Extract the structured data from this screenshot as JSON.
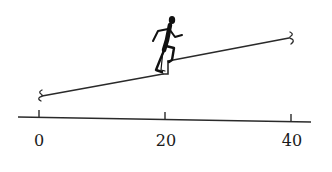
{
  "diagram": {
    "type": "inclined-track-with-runner",
    "axis": {
      "tick_labels": [
        "0",
        "20",
        "40"
      ],
      "tick_values": [
        0,
        20,
        40
      ]
    },
    "track": {
      "segments": [
        {
          "name": "lower-incline",
          "from": 0,
          "to": 20
        },
        {
          "name": "upper-incline",
          "from": 20,
          "to": 40
        }
      ],
      "step_at": 20,
      "end_markers": "brace"
    },
    "figure": {
      "description": "runner climbing step at position 20"
    },
    "colors": {
      "line": "#2a2a2a",
      "figure": "#111111",
      "background": "#ffffff"
    }
  }
}
